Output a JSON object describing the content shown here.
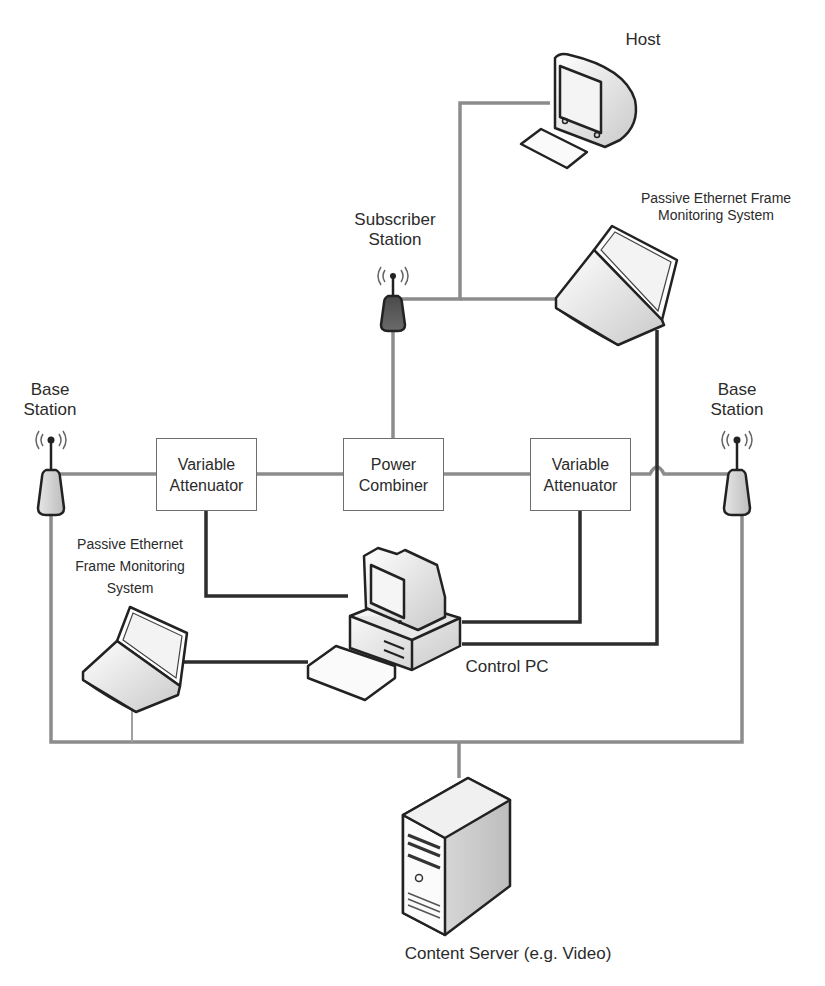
{
  "diagram": {
    "type": "network-testbed",
    "nodes": {
      "host": {
        "label": "Host"
      },
      "pefms_top": {
        "label_line1": "Passive Ethernet Frame",
        "label_line2": "Monitoring System"
      },
      "subscriber_station": {
        "label_line1": "Subscriber",
        "label_line2": "Station"
      },
      "base_station_left": {
        "label_line1": "Base",
        "label_line2": "Station"
      },
      "base_station_right": {
        "label_line1": "Base",
        "label_line2": "Station"
      },
      "attenuator_left": {
        "label_line1": "Variable",
        "label_line2": "Attenuator"
      },
      "power_combiner": {
        "label_line1": "Power",
        "label_line2": "Combiner"
      },
      "attenuator_right": {
        "label_line1": "Variable",
        "label_line2": "Attenuator"
      },
      "pefms_left": {
        "label_line1": "Passive Ethernet",
        "label_line2": "Frame Monitoring",
        "label_line3": "System"
      },
      "control_pc": {
        "label": "Control PC"
      },
      "content_server": {
        "label": "Content Server (e.g. Video)"
      }
    },
    "connections": [
      {
        "from": "Base Station (left)",
        "to": "Variable Attenuator (left)",
        "type": "RF"
      },
      {
        "from": "Variable Attenuator (left)",
        "to": "Power Combiner",
        "type": "RF"
      },
      {
        "from": "Power Combiner",
        "to": "Variable Attenuator (right)",
        "type": "RF"
      },
      {
        "from": "Variable Attenuator (right)",
        "to": "Base Station (right)",
        "type": "RF"
      },
      {
        "from": "Power Combiner",
        "to": "Subscriber Station",
        "type": "RF"
      },
      {
        "from": "Subscriber Station",
        "to": "Host",
        "type": "Ethernet"
      },
      {
        "from": "Subscriber Station",
        "to": "Passive Ethernet Frame Monitoring System (top)",
        "type": "Ethernet"
      },
      {
        "from": "Control PC",
        "to": "Variable Attenuator (left)",
        "type": "Control"
      },
      {
        "from": "Control PC",
        "to": "Variable Attenuator (right)",
        "type": "Control"
      },
      {
        "from": "Control PC",
        "to": "Passive Ethernet Frame Monitoring System (top)",
        "type": "Control"
      },
      {
        "from": "Control PC",
        "to": "Passive Ethernet Frame Monitoring System (left)",
        "type": "Control"
      },
      {
        "from": "Base Station (left)",
        "to": "Content Server",
        "type": "Ethernet"
      },
      {
        "from": "Base Station (right)",
        "to": "Content Server",
        "type": "Ethernet"
      },
      {
        "from": "Passive Ethernet Frame Monitoring System (left)",
        "to": "Content Server",
        "type": "Ethernet"
      }
    ]
  }
}
